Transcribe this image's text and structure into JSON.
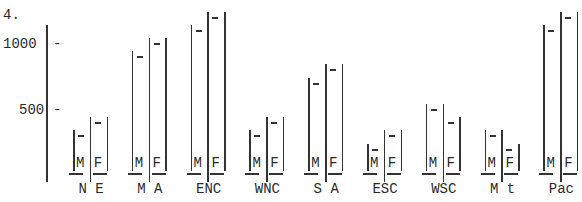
{
  "chart_data": {
    "type": "bar",
    "title": "4.",
    "xlabel": "",
    "ylabel": "",
    "ylim": [
      0,
      1250
    ],
    "yticks": [
      500,
      1000
    ],
    "ytick_labels": [
      "500",
      "1000"
    ],
    "grid": false,
    "legend": [
      "M",
      "F"
    ],
    "categories": [
      "N E",
      "M A",
      "ENC",
      "WNC",
      "S A",
      "ESC",
      "WSC",
      "M t",
      "Pac"
    ],
    "series": [
      {
        "name": "M",
        "values": [
          300,
          900,
          1100,
          300,
          700,
          200,
          500,
          300,
          1100
        ]
      },
      {
        "name": "F",
        "values": [
          400,
          1000,
          1200,
          400,
          800,
          300,
          400,
          200,
          1200
        ]
      }
    ]
  },
  "labels": {
    "title": "4.",
    "ytick_1000": "1000",
    "ytick_500": "500",
    "tick_mark": "-",
    "m": "M",
    "f": "F"
  }
}
